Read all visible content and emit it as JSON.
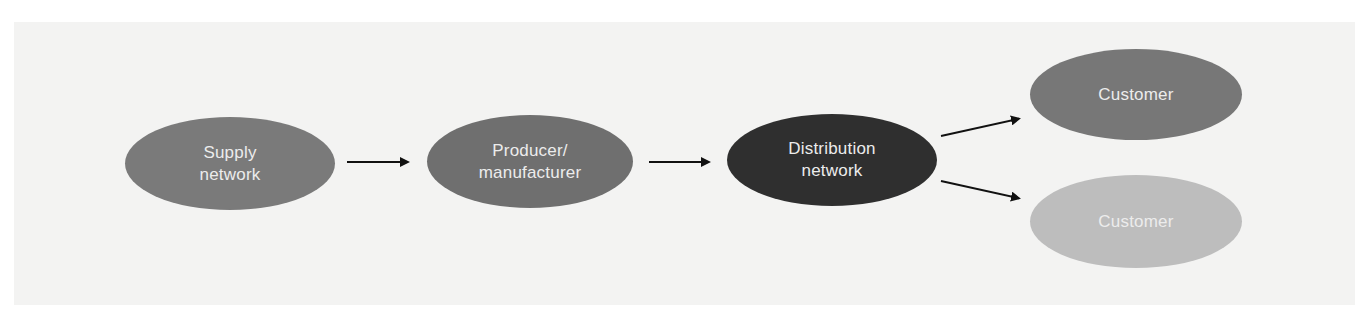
{
  "diagram": {
    "type": "flow",
    "direction": "left-to-right",
    "background_color": "#f3f3f2",
    "nodes": [
      {
        "id": "supply",
        "label": "Supply\nnetwork",
        "color": "#7a7a7a",
        "text_color": "#ececec",
        "box": {
          "x": 125,
          "y": 117,
          "w": 210,
          "h": 93
        }
      },
      {
        "id": "producer",
        "label": "Producer/\nmanufacturer",
        "color": "#6f6f6f",
        "text_color": "#ececec",
        "box": {
          "x": 427,
          "y": 115,
          "w": 206,
          "h": 93
        }
      },
      {
        "id": "distribution",
        "label": "Distribution\nnetwork",
        "color": "#2f2f2f",
        "text_color": "#ececec",
        "box": {
          "x": 727,
          "y": 114,
          "w": 210,
          "h": 92
        }
      },
      {
        "id": "customer1",
        "label": "Customer",
        "color": "#777777",
        "text_color": "#ececec",
        "box": {
          "x": 1030,
          "y": 49,
          "w": 212,
          "h": 91
        }
      },
      {
        "id": "customer2",
        "label": "Customer",
        "color": "#bdbdbd",
        "text_color": "#ececec",
        "box": {
          "x": 1030,
          "y": 175,
          "w": 212,
          "h": 93
        }
      }
    ],
    "edges": [
      {
        "from": "supply",
        "to": "producer",
        "x1": 347,
        "y1": 162,
        "x2": 416,
        "y2": 162
      },
      {
        "from": "producer",
        "to": "distribution",
        "x1": 649,
        "y1": 162,
        "x2": 717,
        "y2": 162
      },
      {
        "from": "distribution",
        "to": "customer1",
        "x1": 941,
        "y1": 136,
        "x2": 1027,
        "y2": 117
      },
      {
        "from": "distribution",
        "to": "customer2",
        "x1": 941,
        "y1": 181,
        "x2": 1027,
        "y2": 200
      }
    ],
    "arrow_color": "#111111"
  }
}
